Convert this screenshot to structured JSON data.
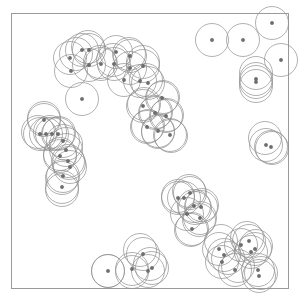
{
  "figure": {
    "title": "",
    "type": "disk-coverage-scatter",
    "background_color": "#ffffff",
    "frame": {
      "x": 11.5,
      "y": 13.5,
      "width": 277,
      "height": 275,
      "stroke_color": "#9a9a9a",
      "stroke_width": 1
    },
    "disk": {
      "radius": 16.5,
      "stroke_color": "#8f8f8f",
      "stroke_width": 0.7,
      "fill": "none"
    },
    "site": {
      "radius": 1.7,
      "fill_color": "#6d6d6d",
      "stroke_color": "#4a4a4a"
    }
  },
  "chart_data": {
    "type": "scatter",
    "title": "",
    "xlabel": "",
    "ylabel": "",
    "xlim": [
      11.5,
      288.5
    ],
    "ylim": [
      13.5,
      288.5
    ],
    "grid": false,
    "legend": null,
    "tick_labels": [],
    "disk_radius": 16.5,
    "point_count": 64,
    "cluster_count": 8,
    "clusters": [
      {
        "name": "top-arc",
        "points": [
          [
            70,
            58
          ],
          [
            71,
            71
          ],
          [
            82,
            50
          ],
          [
            89,
            50
          ],
          [
            89,
            65
          ],
          [
            101,
            64
          ],
          [
            114,
            64
          ],
          [
            116,
            52
          ],
          [
            130,
            56
          ],
          [
            130,
            68
          ],
          [
            143,
            66
          ],
          [
            140,
            81
          ],
          [
            148,
            83
          ],
          [
            124,
            80
          ]
        ]
      },
      {
        "name": "top-isolated",
        "points": [
          [
            82,
            99
          ]
        ]
      },
      {
        "name": "mid-right-chain",
        "points": [
          [
            143,
            106
          ],
          [
            155,
            113
          ],
          [
            162,
            98
          ],
          [
            147,
            127
          ],
          [
            158,
            131
          ],
          [
            166,
            116
          ],
          [
            170,
            135
          ]
        ]
      },
      {
        "name": "left-upper",
        "points": [
          [
            44,
            120
          ],
          [
            40,
            134
          ],
          [
            46,
            134
          ],
          [
            52,
            134
          ],
          [
            58,
            134
          ]
        ]
      },
      {
        "name": "left-lower",
        "points": [
          [
            63,
            141
          ],
          [
            66,
            150
          ],
          [
            60,
            156
          ],
          [
            68,
            161
          ],
          [
            70,
            167
          ],
          [
            63,
            176
          ],
          [
            62,
            187
          ]
        ]
      },
      {
        "name": "bottom-right-upper",
        "points": [
          [
            178,
            198
          ],
          [
            184,
            198
          ],
          [
            190,
            193
          ],
          [
            194,
            206
          ],
          [
            187,
            214
          ],
          [
            200,
            218
          ],
          [
            201,
            207
          ],
          [
            192,
            229
          ]
        ]
      },
      {
        "name": "bottom-right-lower",
        "points": [
          [
            219,
            249
          ],
          [
            224,
            255
          ],
          [
            222,
            262
          ],
          [
            241,
            245
          ],
          [
            249,
            241
          ],
          [
            251,
            252
          ],
          [
            255,
            249
          ],
          [
            235,
            270
          ],
          [
            258,
            270
          ],
          [
            259,
            276
          ]
        ]
      },
      {
        "name": "bottom-center",
        "points": [
          [
            108,
            271
          ],
          [
            132,
            269
          ],
          [
            143,
            254
          ],
          [
            148,
            271
          ],
          [
            152,
            268
          ]
        ]
      },
      {
        "name": "top-right-sparse",
        "points": [
          [
            212,
            40
          ],
          [
            243,
            40
          ],
          [
            272,
            23
          ],
          [
            281,
            60
          ],
          [
            256,
            79
          ],
          [
            256,
            82
          ]
        ]
      },
      {
        "name": "right-middle",
        "points": [
          [
            266,
            145
          ],
          [
            271,
            147
          ]
        ]
      }
    ],
    "disk_extra_centers": [
      [
        265,
        138
      ],
      [
        272,
        148
      ],
      [
        256,
        73
      ],
      [
        256,
        86
      ],
      [
        221,
        241
      ],
      [
        228,
        258
      ],
      [
        247,
        238
      ],
      [
        256,
        246
      ],
      [
        238,
        266
      ],
      [
        261,
        273
      ],
      [
        140,
        250
      ],
      [
        150,
        264
      ],
      [
        132,
        272
      ],
      [
        108,
        271
      ],
      [
        66,
        144
      ],
      [
        60,
        154
      ],
      [
        69,
        163
      ],
      [
        62,
        178
      ],
      [
        62,
        190
      ],
      [
        44,
        118
      ],
      [
        38,
        132
      ],
      [
        50,
        132
      ],
      [
        59,
        133
      ],
      [
        76,
        54
      ],
      [
        88,
        47
      ],
      [
        100,
        62
      ],
      [
        113,
        60
      ],
      [
        129,
        54
      ],
      [
        143,
        62
      ],
      [
        146,
        80
      ],
      [
        144,
        104
      ],
      [
        156,
        112
      ],
      [
        163,
        97
      ],
      [
        148,
        126
      ],
      [
        158,
        132
      ],
      [
        167,
        115
      ],
      [
        171,
        136
      ],
      [
        178,
        196
      ],
      [
        189,
        191
      ],
      [
        195,
        208
      ],
      [
        199,
        220
      ],
      [
        202,
        205
      ],
      [
        191,
        230
      ]
    ]
  }
}
